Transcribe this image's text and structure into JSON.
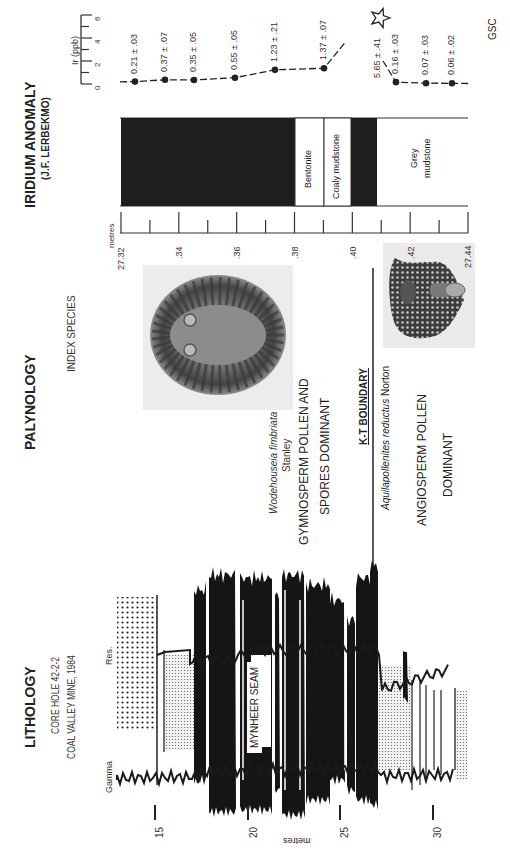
{
  "sections": {
    "lithology": {
      "title": "LITHOLOGY",
      "line1": "CORE HOLE 42-2-2",
      "line2": "COAL VALLEY MINE, 1984",
      "log_left_label": "Gamma",
      "log_right_label": "Res.",
      "seam_label": "MYNHEER SEAM",
      "axis_label": "metres",
      "ticks": [
        "15",
        "20",
        "25",
        "30"
      ]
    },
    "palynology": {
      "title": "PALYNOLOGY",
      "index_label": "INDEX SPECIES",
      "species_upper": "Wodehouseia fimbriata",
      "species_upper_author": "Stanley",
      "zone_upper_line1": "GYMNOSPERM POLLEN  AND",
      "zone_upper_line2": "SPORES DOMINANT",
      "boundary_label": "K-T BOUNDARY",
      "species_lower": "Aquilapollenites reductus",
      "species_lower_author": "Norton",
      "zone_lower_line1": "ANGIOSPERM  POLLEN",
      "zone_lower_line2": "DOMINANT"
    },
    "iridium": {
      "title": "IRIDIUM ANOMALY",
      "author": "(J.F. LERBEKMO)",
      "axis_label": "Ir (ppb)",
      "axis_ticks": [
        "0",
        "2",
        "4",
        "6"
      ],
      "depth_label": "metres",
      "depth_ticks": [
        "27.32",
        ".34",
        ".36",
        ".38",
        ".40",
        ".42",
        "27.44"
      ],
      "units": [
        {
          "name": "Coal",
          "label": ""
        },
        {
          "name": "Bentonite",
          "label": "Bentonite"
        },
        {
          "name": "Coaly mudstone",
          "label": "Coaly mudstone"
        },
        {
          "name": "Coal",
          "label": ""
        },
        {
          "name": "Grey mudstone",
          "label": "Grey\nmudstone"
        }
      ],
      "credit": "GSC"
    }
  },
  "chart_data": {
    "type": "line",
    "title": "Iridium Anomaly",
    "xlabel": "Depth (metres)",
    "ylabel": "Ir (ppb)",
    "ylim": [
      0,
      6
    ],
    "xlim": [
      27.32,
      27.44
    ],
    "points": [
      {
        "label": "0.21 ± .03",
        "value": 0.21,
        "err": 0.03
      },
      {
        "label": "0.37 ± .07",
        "value": 0.37,
        "err": 0.07
      },
      {
        "label": "0.35 ± .05",
        "value": 0.35,
        "err": 0.05
      },
      {
        "label": "0.55 ± .05",
        "value": 0.55,
        "err": 0.05
      },
      {
        "label": "1.23 ± .21",
        "value": 1.23,
        "err": 0.21
      },
      {
        "label": "1.37 ± .07",
        "value": 1.37,
        "err": 0.07
      },
      {
        "label": "5.65 ± .41",
        "value": 5.65,
        "err": 0.41,
        "marker": "star"
      },
      {
        "label": "0.16 ± .03",
        "value": 0.16,
        "err": 0.03
      },
      {
        "label": "0.07 ± .03",
        "value": 0.07,
        "err": 0.03
      },
      {
        "label": "0.06 ± .02",
        "value": 0.06,
        "err": 0.02
      }
    ]
  }
}
